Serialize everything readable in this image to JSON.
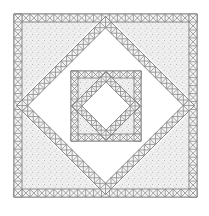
{
  "figure": {
    "colors": {
      "background": "#ffffff",
      "line": "#8a8a8a",
      "speckle_fill": "#ececec",
      "speckle_dot": "#b4b4b4"
    },
    "layers": [
      {
        "name": "outer-square",
        "x": 14,
        "y": 14,
        "size": 183,
        "band": 8
      },
      {
        "name": "outer-diamond",
        "cx": 105.5,
        "cy": 105.5,
        "half_diagonal": 91,
        "band": 8
      },
      {
        "name": "inner-square",
        "x": 71,
        "y": 71,
        "size": 70,
        "band": 7
      },
      {
        "name": "inner-diamond",
        "cx": 106,
        "cy": 106,
        "half_diagonal": 34,
        "band": 7
      }
    ]
  }
}
